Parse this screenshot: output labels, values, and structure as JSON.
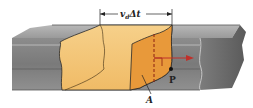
{
  "diagram": {
    "labels": {
      "length": "v",
      "length_sub": "d",
      "length_rest": "Δt",
      "area": "A",
      "point": "P"
    },
    "colors": {
      "conductor_gray": "#8a8a8a",
      "conductor_dark": "#6a6a6a",
      "conductor_top": "#a8a8a8",
      "charge_volume": "#f3c272",
      "charge_face": "#e9a040",
      "arrow": "#c0302a",
      "outline": "#2a2a2a"
    }
  }
}
